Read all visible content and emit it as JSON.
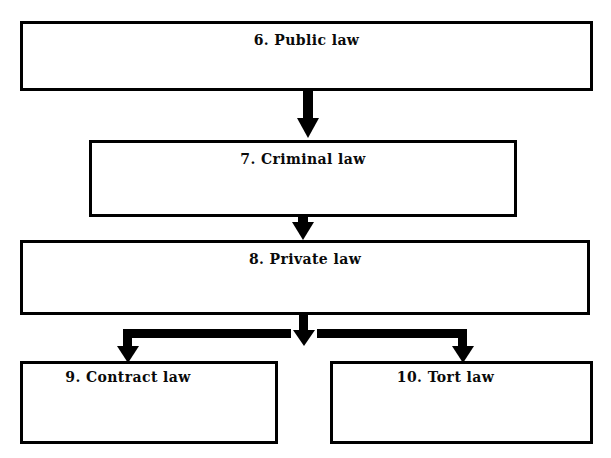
{
  "diagram": {
    "type": "flowchart",
    "orientation": "top-to-bottom",
    "background_color": "#ffffff",
    "line_color": "#000000",
    "text_color": "#0a0a0a",
    "nodes": [
      {
        "id": "node-6",
        "label": "6. Public law",
        "number": "6",
        "name": "Public law"
      },
      {
        "id": "node-7",
        "label": "7. Criminal law",
        "number": "7",
        "name": "Criminal law"
      },
      {
        "id": "node-8",
        "label": "8. Private law",
        "number": "8",
        "name": "Private law"
      },
      {
        "id": "node-9",
        "label": "9. Contract law",
        "number": "9",
        "name": "Contract law"
      },
      {
        "id": "node-10",
        "label": "10. Tort law",
        "number": "10",
        "name": "Tort law"
      }
    ],
    "edges": [
      {
        "from": "6. Public law",
        "to": "7. Criminal law",
        "style": "thick-arrow-down"
      },
      {
        "from": "7. Criminal law",
        "to": "8. Private law",
        "style": "thick-arrow-down"
      },
      {
        "from": "8. Private law",
        "to": "9. Contract law",
        "style": "thick-elbow-arrow-down-left"
      },
      {
        "from": "8. Private law",
        "to": "10. Tort law",
        "style": "thick-elbow-arrow-down-right"
      }
    ]
  }
}
